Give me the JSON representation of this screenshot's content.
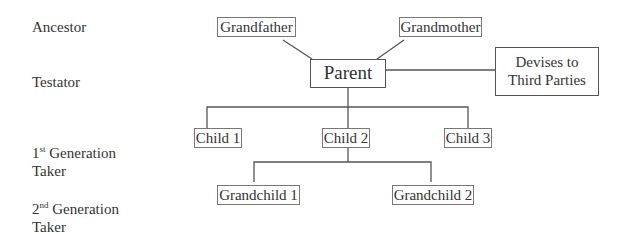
{
  "rows": {
    "ancestor": "Ancestor",
    "testator": "Testator",
    "first_gen": {
      "num": "1",
      "sup": "st",
      "rest": " Generation",
      "line2": "Taker"
    },
    "second_gen": {
      "num": "2",
      "sup": "nd",
      "rest": " Generation",
      "line2": "Taker"
    }
  },
  "nodes": {
    "grandfather": "Grandfather",
    "grandmother": "Grandmother",
    "parent": "Parent",
    "devises_line1": "Devises to",
    "devises_line2": "Third Parties",
    "child1": "Child 1",
    "child2": "Child 2",
    "child3": "Child 3",
    "grandchild1": "Grandchild 1",
    "grandchild2": "Grandchild 2"
  },
  "colors": {
    "line": "#555555",
    "box_border": "#777777",
    "text": "#333333"
  }
}
